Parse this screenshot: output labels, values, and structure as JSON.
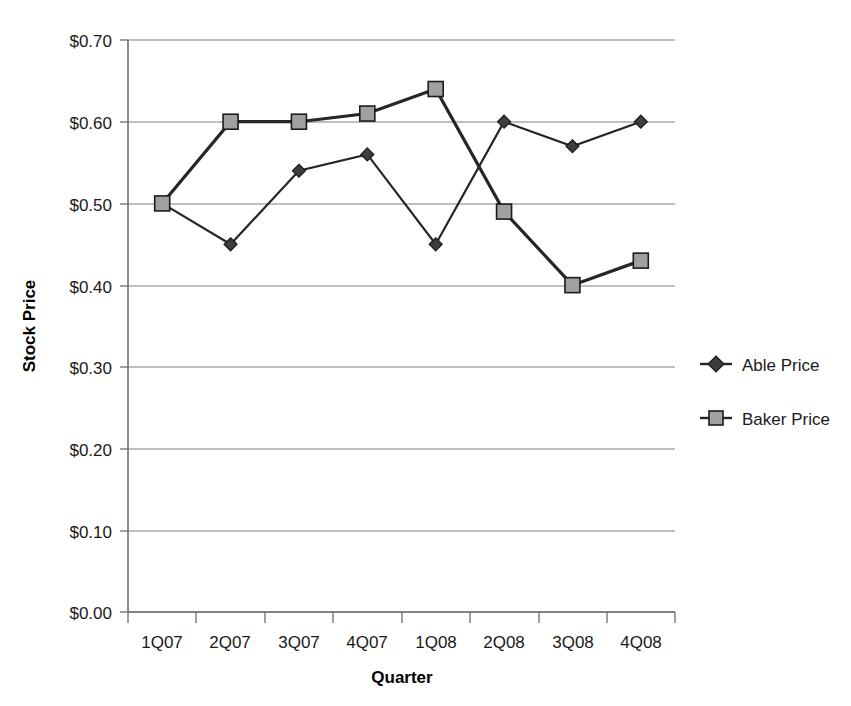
{
  "chart_data": {
    "type": "line",
    "title": "",
    "xlabel": "Quarter",
    "ylabel": "Stock Price",
    "categories": [
      "1Q07",
      "2Q07",
      "3Q07",
      "4Q07",
      "1Q08",
      "2Q08",
      "3Q08",
      "4Q08"
    ],
    "series": [
      {
        "name": "Able Price",
        "marker": "diamond",
        "color": "#3d3d3d",
        "values": [
          0.5,
          0.45,
          0.54,
          0.56,
          0.45,
          0.6,
          0.57,
          0.6
        ]
      },
      {
        "name": "Baker Price",
        "marker": "square",
        "color": "#a0a0a0",
        "values": [
          0.5,
          0.6,
          0.6,
          0.61,
          0.64,
          0.49,
          0.4,
          0.43
        ]
      }
    ],
    "ylim": [
      0.0,
      0.7
    ],
    "ytick_values": [
      0.0,
      0.1,
      0.2,
      0.3,
      0.4,
      0.5,
      0.6,
      0.7
    ],
    "ytick_labels": [
      "$0.00",
      "$0.10",
      "$0.20",
      "$0.30",
      "$0.40",
      "$0.50",
      "$0.60",
      "$0.70"
    ],
    "grid": true,
    "legend_position": "right",
    "legend_entries": [
      "Able Price",
      "Baker Price"
    ]
  },
  "axes": {
    "y_title": "Stock Price",
    "x_title": "Quarter"
  },
  "legend": {
    "items": [
      {
        "label": "Able Price",
        "marker": "diamond-marker-icon"
      },
      {
        "label": "Baker Price",
        "marker": "square-marker-icon"
      }
    ]
  }
}
